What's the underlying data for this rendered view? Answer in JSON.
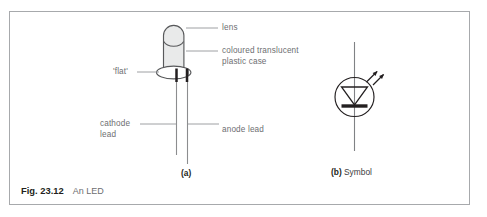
{
  "figure": {
    "caption_number": "Fig. 23.12",
    "caption_text": "An LED",
    "border_color": "#a7a9ac",
    "background_color": "#ffffff"
  },
  "diagram_a": {
    "part_letter": "(a)",
    "part_letter_suffix": "",
    "labels": {
      "lens": "lens",
      "case_line1": "coloured translucent",
      "case_line2": "plastic case",
      "flat": "'flat'",
      "cathode_line1": "cathode",
      "cathode_line2": "lead",
      "anode": "anode lead"
    },
    "colors": {
      "body_fill": "#e9eaea",
      "body_stroke": "#58595b",
      "lead_dark": "#231f20",
      "lead_light": "#8c8d8f",
      "leader_line": "#939598"
    }
  },
  "diagram_b": {
    "part_letter": "(b)",
    "part_label": " Symbol",
    "colors": {
      "symbol_stroke": "#231f20",
      "wire_stroke": "#808285",
      "bar_fill": "#231f20"
    }
  }
}
